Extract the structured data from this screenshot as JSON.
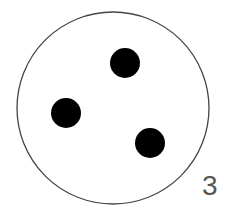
{
  "diagram": {
    "label": "3",
    "circle": {
      "cx": 113,
      "cy": 108,
      "r": 96,
      "stroke": "#444444"
    },
    "dots": [
      {
        "cx": 125,
        "cy": 63,
        "r": 15,
        "fill": "#000000"
      },
      {
        "cx": 66,
        "cy": 113,
        "r": 15,
        "fill": "#000000"
      },
      {
        "cx": 150,
        "cy": 143,
        "r": 15,
        "fill": "#000000"
      }
    ],
    "dot_count": 3
  }
}
